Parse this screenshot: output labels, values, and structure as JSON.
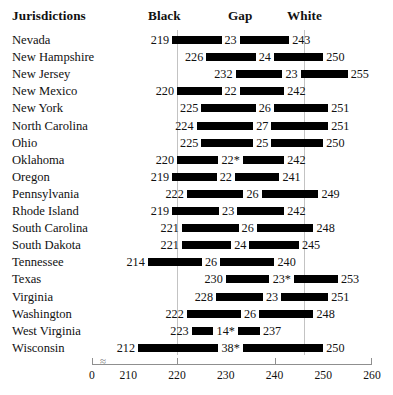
{
  "header": {
    "jurisdictions_label": "Jurisdictions",
    "black_label": "Black",
    "gap_label": "Gap",
    "white_label": "White"
  },
  "chart_data": {
    "type": "bar",
    "title": "",
    "subtitle": "",
    "xlabel": "",
    "ylabel": "Jurisdictions",
    "orientation": "horizontal",
    "style": "range-bar / dumbbell",
    "grid": true,
    "gridlines": [
      220,
      246
    ],
    "legend_position": "top (column headers)",
    "axis_break": true,
    "axis_break_note": "axis broken between 0 and 210",
    "xlim": [
      210,
      260
    ],
    "x_origin_label": "0",
    "xticks": [
      210,
      220,
      230,
      240,
      250,
      260
    ],
    "xtick_labels": [
      "210",
      "220",
      "230",
      "240",
      "250",
      "260"
    ],
    "columns": [
      "Jurisdiction",
      "Black",
      "Gap",
      "White"
    ],
    "footnote_marker": "*",
    "categories": [
      "Nevada",
      "New Hampshire",
      "New Jersey",
      "New Mexico",
      "New York",
      "North Carolina",
      "Ohio",
      "Oklahoma",
      "Oregon",
      "Pennsylvania",
      "Rhode Island",
      "South Carolina",
      "South Dakota",
      "Tennessee",
      "Texas",
      "Virginia",
      "Washington",
      "West Virginia",
      "Wisconsin"
    ],
    "series": [
      {
        "name": "Black",
        "values": [
          219,
          226,
          232,
          220,
          225,
          224,
          225,
          220,
          219,
          222,
          219,
          221,
          221,
          214,
          230,
          228,
          222,
          223,
          212
        ]
      },
      {
        "name": "Gap",
        "values": [
          23,
          24,
          23,
          22,
          26,
          27,
          25,
          22,
          22,
          26,
          23,
          26,
          24,
          26,
          23,
          23,
          26,
          14,
          38
        ]
      },
      {
        "name": "White",
        "values": [
          243,
          250,
          255,
          242,
          251,
          251,
          250,
          242,
          241,
          249,
          242,
          248,
          245,
          240,
          253,
          251,
          248,
          237,
          250
        ]
      }
    ],
    "rows": [
      {
        "jurisdiction": "Nevada",
        "black": 219,
        "gap": 23,
        "white": 243,
        "gap_label": "23",
        "black_label": "219",
        "white_label": "243",
        "starred": false
      },
      {
        "jurisdiction": "New Hampshire",
        "black": 226,
        "gap": 24,
        "white": 250,
        "gap_label": "24",
        "black_label": "226",
        "white_label": "250",
        "starred": false
      },
      {
        "jurisdiction": "New Jersey",
        "black": 232,
        "gap": 23,
        "white": 255,
        "gap_label": "23",
        "black_label": "232",
        "white_label": "255",
        "starred": false
      },
      {
        "jurisdiction": "New Mexico",
        "black": 220,
        "gap": 22,
        "white": 242,
        "gap_label": "22",
        "black_label": "220",
        "white_label": "242",
        "starred": false
      },
      {
        "jurisdiction": "New York",
        "black": 225,
        "gap": 26,
        "white": 251,
        "gap_label": "26",
        "black_label": "225",
        "white_label": "251",
        "starred": false
      },
      {
        "jurisdiction": "North Carolina",
        "black": 224,
        "gap": 27,
        "white": 251,
        "gap_label": "27",
        "black_label": "224",
        "white_label": "251",
        "starred": false
      },
      {
        "jurisdiction": "Ohio",
        "black": 225,
        "gap": 25,
        "white": 250,
        "gap_label": "25",
        "black_label": "225",
        "white_label": "250",
        "starred": false
      },
      {
        "jurisdiction": "Oklahoma",
        "black": 220,
        "gap": 22,
        "white": 242,
        "gap_label": "22*",
        "black_label": "220",
        "white_label": "242",
        "starred": true
      },
      {
        "jurisdiction": "Oregon",
        "black": 219,
        "gap": 22,
        "white": 241,
        "gap_label": "22",
        "black_label": "219",
        "white_label": "241",
        "starred": false
      },
      {
        "jurisdiction": "Pennsylvania",
        "black": 222,
        "gap": 26,
        "white": 249,
        "gap_label": "26",
        "black_label": "222",
        "white_label": "249",
        "starred": false
      },
      {
        "jurisdiction": "Rhode Island",
        "black": 219,
        "gap": 23,
        "white": 242,
        "gap_label": "23",
        "black_label": "219",
        "white_label": "242",
        "starred": false
      },
      {
        "jurisdiction": "South Carolina",
        "black": 221,
        "gap": 26,
        "white": 248,
        "gap_label": "26",
        "black_label": "221",
        "white_label": "248",
        "starred": false
      },
      {
        "jurisdiction": "South Dakota",
        "black": 221,
        "gap": 24,
        "white": 245,
        "gap_label": "24",
        "black_label": "221",
        "white_label": "245",
        "starred": false
      },
      {
        "jurisdiction": "Tennessee",
        "black": 214,
        "gap": 26,
        "white": 240,
        "gap_label": "26",
        "black_label": "214",
        "white_label": "240",
        "starred": false
      },
      {
        "jurisdiction": "Texas",
        "black": 230,
        "gap": 23,
        "white": 253,
        "gap_label": "23*",
        "black_label": "230",
        "white_label": "253",
        "starred": true
      },
      {
        "jurisdiction": "Virginia",
        "black": 228,
        "gap": 23,
        "white": 251,
        "gap_label": "23",
        "black_label": "228",
        "white_label": "251",
        "starred": false
      },
      {
        "jurisdiction": "Washington",
        "black": 222,
        "gap": 26,
        "white": 248,
        "gap_label": "26",
        "black_label": "222",
        "white_label": "248",
        "starred": false
      },
      {
        "jurisdiction": "West Virginia",
        "black": 223,
        "gap": 14,
        "white": 237,
        "gap_label": "14*",
        "black_label": "223",
        "white_label": "237",
        "starred": true
      },
      {
        "jurisdiction": "Wisconsin",
        "black": 212,
        "gap": 38,
        "white": 250,
        "gap_label": "38*",
        "black_label": "212",
        "white_label": "250",
        "starred": true
      }
    ],
    "colors": {
      "bar": "#000000",
      "gridline": "#b8b8b8",
      "axis": "#8f8f8f",
      "text": "#111111",
      "background": "#ffffff"
    }
  },
  "axis": {
    "origin_label": "0",
    "tick_labels": [
      "210",
      "220",
      "230",
      "240",
      "250",
      "260"
    ],
    "break_glyph": "≈"
  }
}
